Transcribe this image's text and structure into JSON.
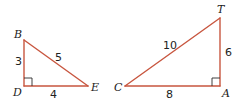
{
  "colors": {
    "edge": "#c8563f",
    "right_angle_mark": "#2b2b2b",
    "text": "#222222",
    "background": "#ffffff"
  },
  "triangles": [
    {
      "name": "BDE",
      "vertices": [
        {
          "label": "B",
          "x": 24,
          "y": 40
        },
        {
          "label": "D",
          "x": 24,
          "y": 86
        },
        {
          "label": "E",
          "x": 88,
          "y": 86
        }
      ],
      "right_angle_at": "D",
      "sides": [
        {
          "between": "BD",
          "length": "3"
        },
        {
          "between": "DE",
          "length": "4"
        },
        {
          "between": "BE",
          "length": "5"
        }
      ]
    },
    {
      "name": "CAT",
      "vertices": [
        {
          "label": "C",
          "x": 125,
          "y": 86
        },
        {
          "label": "A",
          "x": 220,
          "y": 86
        },
        {
          "label": "T",
          "x": 220,
          "y": 18
        }
      ],
      "right_angle_at": "A",
      "sides": [
        {
          "between": "CA",
          "length": "8"
        },
        {
          "between": "AT",
          "length": "6"
        },
        {
          "between": "CT",
          "length": "10"
        }
      ]
    }
  ],
  "labels": {
    "B": "B",
    "D": "D",
    "E": "E",
    "C": "C",
    "A": "A",
    "T": "T",
    "BD": "3",
    "DE": "4",
    "BE": "5",
    "CA": "8",
    "AT": "6",
    "CT": "10"
  }
}
